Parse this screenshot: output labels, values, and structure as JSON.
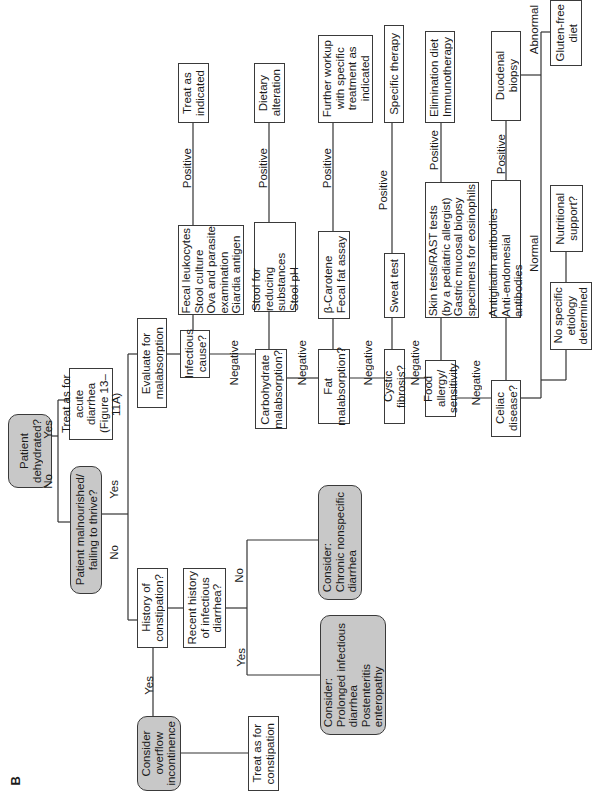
{
  "panel_label": "B",
  "nodes": {
    "dehydrated": "Patient\ndehydrated?",
    "malnourished": "Patient malnourished/\nfailing to thrive?",
    "treat_acute": "Treat as for\nacute diarrhea\n(Figure 13–11A)",
    "evaluate_malabsorption": "Evaluate for\nmalabsorption",
    "history_constipation": "History of\nconstipation?",
    "overflow": "Consider\noverflow\nincontinence",
    "treat_constipation": "Treat as for\nconstipation",
    "recent_infectious": "Recent history\nof infectious\ndiarrhea?",
    "chronic_nonspecific": "Consider:\n    Chronic nonspecific\n    diarrhea",
    "prolonged_infectious": "Consider:\n    Prolonged infectious\n    diarrhea\n    Postenteritis\n    enteropathy",
    "infectious_cause": "Infectious\ncause?",
    "infectious_tests": "Fecal leukocytes\nStool culture\nOva and parasite\n    examination\nGiardia antigen",
    "treat_indicated": "Treat as\nindicated",
    "carbohydrate": "Carbohydrate\nmalabsorption?",
    "carbohydrate_tests": "Stool for reducing\n    substances\nStool pH",
    "dietary_alteration": "Dietary\nalteration",
    "fat": "Fat\nmalabsorption?",
    "fat_tests": "β-Carotene\nFecal fat assay",
    "further_workup": "Further workup\nwith specific\ntreatment as\nindicated",
    "cystic_fibrosis": "Cystic fibrosis?",
    "sweat_test": "Sweat test",
    "specific_therapy": "Specific therapy",
    "food_allergy": "Food allergy/\nsensitivity",
    "allergy_tests": "Skin tests/RAST tests\n    (by a pediatric allergist)\nGastric mucosal biopsy\n    specimens for eosinophils",
    "elimination_diet": "Elimination diet\nImmunotherapy",
    "celiac": "Celiac\ndisease?",
    "celiac_tests": "Antigliadin antibodies\nAnti-endomesial antibodies",
    "duodenal_biopsy": "Duodenal\nbiopsy",
    "gluten_free": "Gluten-free\ndiet",
    "no_specific": "No specific\netiology\ndetermined",
    "nutritional_support": "Nutritional\nsupport?"
  },
  "edge_labels": {
    "no": "No",
    "yes": "Yes",
    "negative": "Negative",
    "positive": "Positive",
    "normal": "Normal",
    "abnormal": "Abnormal"
  },
  "colors": {
    "decision_fill": "#c8c8c8",
    "box_fill": "#ffffff",
    "line": "#333333"
  }
}
